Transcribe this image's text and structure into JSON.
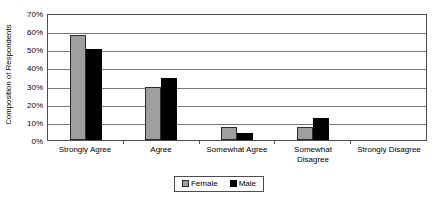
{
  "chart_data": {
    "type": "bar",
    "title": "",
    "xlabel": "",
    "ylabel": "Composition of Respondents",
    "ylim": [
      0,
      70
    ],
    "ytick_step": 10,
    "ytick_labels": [
      "70%",
      "60%",
      "50%",
      "40%",
      "30%",
      "20%",
      "10%",
      "0%"
    ],
    "ytick_values": [
      70,
      60,
      50,
      40,
      30,
      20,
      10,
      0
    ],
    "grid": true,
    "legend_position": "bottom",
    "categories": [
      "Strongly Agree",
      "Agree",
      "Somewhat Agree",
      "Somewhat Disagree",
      "Strongly Disagree"
    ],
    "category_lines": [
      [
        "Strongly Agree"
      ],
      [
        "Agree"
      ],
      [
        "Somewhat Agree"
      ],
      [
        "Somewhat",
        "Disagree"
      ],
      [
        "Strongly Disagree"
      ]
    ],
    "series": [
      {
        "name": "Female",
        "color": "#9e9e9e",
        "values": [
          58,
          29,
          7,
          7,
          0
        ]
      },
      {
        "name": "Male",
        "color": "#000000",
        "values": [
          50,
          34,
          4,
          12,
          0
        ]
      }
    ]
  },
  "legend": {
    "items": [
      {
        "label": "Female",
        "swatch": "gray-square-swatch"
      },
      {
        "label": "Male",
        "swatch": "black-square-swatch"
      }
    ]
  },
  "colors": {
    "female_fill": "#9e9e9e",
    "male_fill": "#000000",
    "gridline": "#7a7a7a",
    "axis": "#4d4d4d",
    "background": "#ffffff"
  }
}
